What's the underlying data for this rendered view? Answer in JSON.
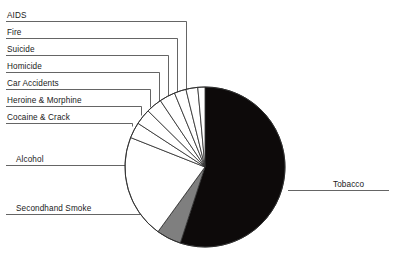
{
  "chart_data": {
    "type": "pie",
    "title": "",
    "subtitle": "",
    "xlabel": "",
    "ylabel": "",
    "grid": false,
    "legend_position": "callout-labels",
    "start_angle_deg": 0,
    "direction": "clockwise",
    "center": {
      "x": 205,
      "y": 167
    },
    "radius": 80,
    "categories": [
      "Tobacco",
      "Secondhand Smoke",
      "Alcohol",
      "Cocaine & Crack",
      "Heroine & Morphine",
      "Car Accidents",
      "Homicide",
      "Suicide",
      "Fire",
      "AIDS"
    ],
    "values": [
      55,
      5,
      21,
      3.2,
      3.2,
      3.2,
      3.2,
      2.4,
      2.4,
      2.4
    ],
    "slices": [
      {
        "label": "Tobacco",
        "value": 55,
        "color": "#0d0a0a",
        "start_deg": 0,
        "end_deg": 198,
        "label_side": "right"
      },
      {
        "label": "Secondhand Smoke",
        "value": 5,
        "color": "#7f7f7f",
        "start_deg": 198,
        "end_deg": 216,
        "label_side": "left"
      },
      {
        "label": "Alcohol",
        "value": 21,
        "color": "#ffffff",
        "start_deg": 216,
        "end_deg": 291.6,
        "label_side": "left"
      },
      {
        "label": "Cocaine & Crack",
        "value": 3.2,
        "color": "#ffffff",
        "start_deg": 291.6,
        "end_deg": 303.1,
        "label_side": "left"
      },
      {
        "label": "Heroine & Morphine",
        "value": 3.2,
        "color": "#ffffff",
        "start_deg": 303.1,
        "end_deg": 314.6,
        "label_side": "left"
      },
      {
        "label": "Car Accidents",
        "value": 3.2,
        "color": "#ffffff",
        "start_deg": 314.6,
        "end_deg": 326.1,
        "label_side": "left"
      },
      {
        "label": "Homicide",
        "value": 3.2,
        "color": "#ffffff",
        "start_deg": 326.1,
        "end_deg": 337.6,
        "label_side": "left"
      },
      {
        "label": "Suicide",
        "value": 2.4,
        "color": "#ffffff",
        "start_deg": 337.6,
        "end_deg": 346.2,
        "label_side": "left"
      },
      {
        "label": "Fire",
        "value": 2.4,
        "color": "#ffffff",
        "start_deg": 346.2,
        "end_deg": 354.8,
        "label_side": "left"
      },
      {
        "label": "AIDS",
        "value": 2.4,
        "color": "#ffffff",
        "start_deg": 354.8,
        "end_deg": 360,
        "label_side": "left"
      }
    ]
  },
  "labels": {
    "aids": "AIDS",
    "fire": "Fire",
    "suicide": "Suicide",
    "homicide": "Homicide",
    "car_accidents": "Car Accidents",
    "heroine_morphine": "Heroine & Morphine",
    "cocaine_crack": "Cocaine & Crack",
    "alcohol": "Alcohol",
    "secondhand_smoke": "Secondhand Smoke",
    "tobacco": "Tobacco"
  },
  "colors": {
    "background": "#ffffff",
    "tobacco_slice": "#0d0a0a",
    "secondhand_smoke_slice": "#7f7f7f",
    "other_slices": "#ffffff",
    "outline": "#2b2b2b",
    "leader_line": "#3d3d3d",
    "text": "#1a1a1a"
  }
}
